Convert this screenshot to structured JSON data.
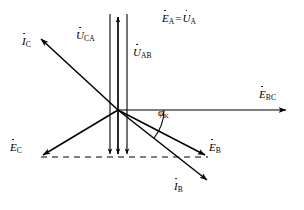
{
  "figure": {
    "type": "phasor-diagram",
    "background_color": "#ffffff",
    "line_color": "#000000",
    "origin": {
      "x": 118,
      "y": 110
    },
    "labels": {
      "ea_ua": {
        "symbol1": "E",
        "sub1": "A",
        "equals": "=",
        "symbol2": "U",
        "sub2": "A"
      },
      "uca": {
        "symbol": "U",
        "sub": "CA"
      },
      "uab": {
        "symbol": "U",
        "sub": "AB"
      },
      "ic": {
        "symbol": "I",
        "sub": "C"
      },
      "ib": {
        "symbol": "I",
        "sub": "B"
      },
      "ebc": {
        "symbol": "E",
        "sub": "BC"
      },
      "eb": {
        "symbol": "E",
        "sub": "B"
      },
      "ec": {
        "symbol": "E",
        "sub": "C"
      },
      "phi_k": {
        "symbol": "φ",
        "sub": "K"
      }
    },
    "vectors": [
      {
        "name": "E_A = U_A",
        "from": [
          118,
          110
        ],
        "to": [
          127,
          14
        ],
        "arrow": "none",
        "style": "solid"
      },
      {
        "name": "U_CA",
        "from": [
          110,
          14
        ],
        "to": [
          110,
          157
        ],
        "arrow": "end-down",
        "style": "solid"
      },
      {
        "name": "U_A_axis",
        "from": [
          118,
          14
        ],
        "to": [
          118,
          157
        ],
        "arrow": "both",
        "style": "solid"
      },
      {
        "name": "U_AB",
        "from": [
          127,
          14
        ],
        "to": [
          127,
          157
        ],
        "arrow": "end-down",
        "style": "solid"
      },
      {
        "name": "E_BC",
        "from": [
          118,
          110
        ],
        "to": [
          289,
          110
        ],
        "arrow": "end",
        "style": "solid"
      },
      {
        "name": "I_C",
        "from": [
          118,
          110
        ],
        "to": [
          38,
          36
        ],
        "arrow": "end",
        "style": "solid"
      },
      {
        "name": "I_B",
        "from": [
          118,
          110
        ],
        "to": [
          210,
          183
        ],
        "arrow": "end",
        "style": "solid"
      },
      {
        "name": "E_B",
        "from": [
          118,
          110
        ],
        "to": [
          208,
          157
        ],
        "arrow": "end",
        "style": "solid"
      },
      {
        "name": "E_C",
        "from": [
          118,
          110
        ],
        "to": [
          40,
          157
        ],
        "arrow": "end",
        "style": "solid"
      },
      {
        "name": "baseline",
        "from": [
          40,
          157
        ],
        "to": [
          208,
          157
        ],
        "arrow": "none",
        "style": "dashed"
      }
    ],
    "angle_arc": {
      "name": "phi_K",
      "center": [
        118,
        110
      ],
      "radius": 46,
      "from_deg": 0,
      "to_deg": 38
    }
  }
}
